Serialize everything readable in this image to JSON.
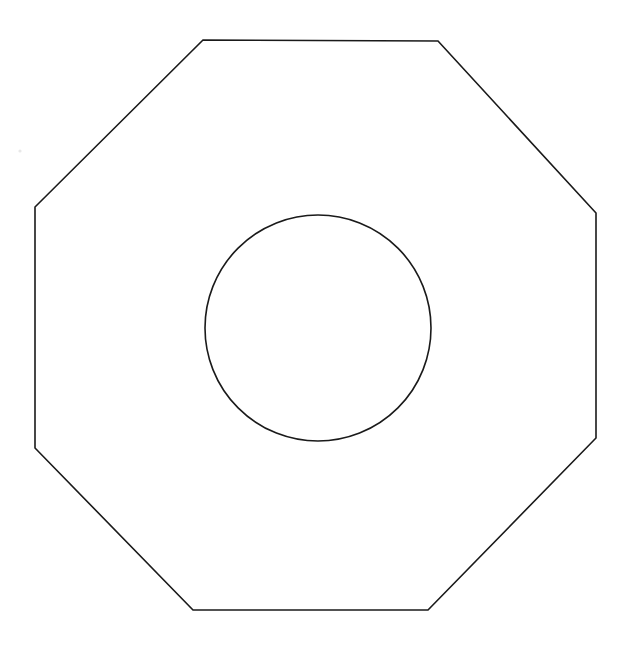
{
  "canvas": {
    "width": 624,
    "height": 645,
    "background_color": "#ffffff",
    "title": "Octagon with inscribed circle line drawing"
  },
  "style": {
    "stroke_color": "#1a1a1a",
    "stroke_width": 1.6,
    "fill": "none"
  },
  "chart_data": {
    "type": "diagram",
    "title": "",
    "subtitle": "",
    "xlabel": "",
    "ylabel": "",
    "grid": false,
    "legend": false,
    "shapes": [
      {
        "name": "octagon",
        "kind": "polygon",
        "sides": 8,
        "stroke": "#1a1a1a",
        "fill": "none",
        "points": "203,40 438,41 596,213 596,438 428,610 193,610 35,448 35,207",
        "vertices": [
          {
            "label": "top-left",
            "x": 203,
            "y": 40
          },
          {
            "label": "top-right",
            "x": 438,
            "y": 41
          },
          {
            "label": "right-top",
            "x": 596,
            "y": 213
          },
          {
            "label": "right-bottom",
            "x": 596,
            "y": 438
          },
          {
            "label": "bottom-right",
            "x": 428,
            "y": 610
          },
          {
            "label": "bottom-left",
            "x": 193,
            "y": 610
          },
          {
            "label": "left-bottom",
            "x": 35,
            "y": 448
          },
          {
            "label": "left-top",
            "x": 35,
            "y": 207
          }
        ],
        "bounds": {
          "x": 35,
          "y": 40,
          "width": 561,
          "height": 570
        },
        "center": {
          "x": 315,
          "y": 325
        }
      },
      {
        "name": "circle",
        "kind": "circle",
        "stroke": "#1a1a1a",
        "fill": "none",
        "cx": 318,
        "cy": 328,
        "r": 113,
        "bounds": {
          "x": 205,
          "y": 215,
          "width": 226,
          "height": 226
        }
      }
    ],
    "marks": [
      {
        "name": "speck",
        "kind": "dot",
        "cx": 20,
        "cy": 151,
        "r": 1.6,
        "color": "#e8e8e8"
      }
    ]
  }
}
